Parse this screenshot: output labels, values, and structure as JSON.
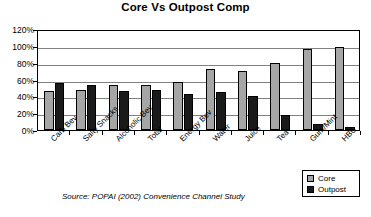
{
  "chart_data": {
    "type": "bar",
    "title": "Core Vs Outpost Comp",
    "xlabel": "",
    "ylabel": "",
    "ylim": [
      0,
      120
    ],
    "ytick_labels": [
      "120%",
      "100%",
      "80%",
      "60%",
      "40%",
      "20%",
      "0%"
    ],
    "ytick_values": [
      120,
      100,
      80,
      60,
      40,
      20,
      0
    ],
    "grid": true,
    "legend_position": "bottom-right",
    "categories": [
      "Carb Bev",
      "Salty Snacks",
      "Alcoholic Bev",
      "Total",
      "Energy Bev",
      "Water",
      "Juice",
      "Tea",
      "Gum/Mint",
      "HBC"
    ],
    "series": [
      {
        "name": "Core",
        "color": "#a6a6a6",
        "values": [
          46,
          47,
          54,
          53,
          57,
          72,
          70,
          80,
          96,
          99
        ]
      },
      {
        "name": "Outpost",
        "color": "#1a1a1a",
        "values": [
          56,
          53,
          46,
          48,
          43,
          45,
          40,
          18,
          7,
          3
        ]
      }
    ],
    "annotations": [
      "Source:  POPAI (2002) Convenience Channel Study"
    ]
  },
  "legend": {
    "core_label": "Core",
    "outpost_label": "Outpost"
  },
  "source": {
    "text": "Source:  POPAI (2002) Convenience Channel Study"
  }
}
